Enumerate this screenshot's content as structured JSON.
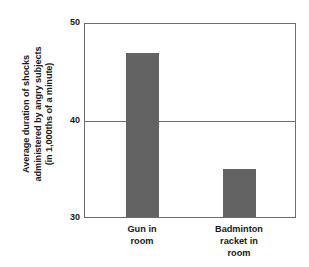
{
  "chart_data": {
    "type": "bar",
    "title": "",
    "subtitle": "",
    "xlabel": "",
    "ylabel": "Average duration of shocks administered by angry subjects (in 1,000ths of a minute)",
    "ylabel_lines": [
      "Average duration of shocks",
      "administered by angry subjects",
      "(in 1,000ths of a minute)"
    ],
    "categories": [
      "Gun in room",
      "Badminton racket in room"
    ],
    "category_lines": [
      [
        "Gun in",
        "room"
      ],
      [
        "Badminton",
        "racket in",
        "room"
      ]
    ],
    "values": [
      47,
      35
    ],
    "ylim": [
      30,
      50
    ],
    "yticks": [
      50,
      40,
      30
    ],
    "ytick_labels": [
      "50",
      "40",
      "30"
    ],
    "grid": "horizontal-at-40",
    "gridlines": [
      40
    ],
    "legend": "none",
    "legend_position": "none",
    "bar_color": "#636363",
    "axis_color": "#6d6d6d",
    "background_color": "#ffffff",
    "text_color": "#1a1a1a"
  }
}
